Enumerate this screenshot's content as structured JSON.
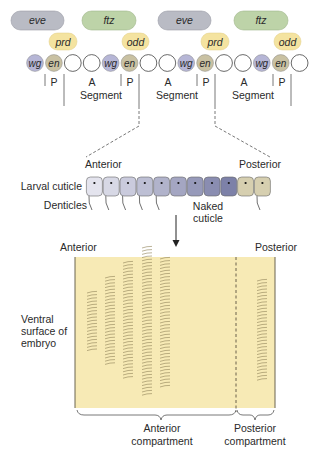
{
  "gene_pills": {
    "row1": [
      {
        "label": "eve",
        "kind": "eve"
      },
      {
        "label": "ftz",
        "kind": "ftz"
      },
      {
        "label": "eve",
        "kind": "eve"
      },
      {
        "label": "ftz",
        "kind": "ftz"
      }
    ],
    "row2": [
      {
        "label": "prd",
        "kind": "pair"
      },
      {
        "label": "odd",
        "kind": "pair"
      },
      {
        "label": "prd",
        "kind": "pair"
      },
      {
        "label": "odd",
        "kind": "pair"
      }
    ]
  },
  "cells": [
    "wg",
    "en",
    "",
    "",
    "wg",
    "en",
    "",
    "",
    "wg",
    "en",
    "",
    "",
    "wg",
    "en",
    ""
  ],
  "segment_labels": {
    "p": "P",
    "a": "A",
    "segment": "Segment"
  },
  "cuticle": {
    "anterior": "Anterior",
    "posterior": "Posterior",
    "larval_cuticle": "Larval cuticle",
    "denticles": "Denticles",
    "naked_cuticle": [
      "Naked",
      "cuticle"
    ],
    "cell_count": 11,
    "posterior_cells": 2
  },
  "embryo": {
    "anterior": "Anterior",
    "posterior": "Posterior",
    "ventral_surface": [
      "Ventral",
      "surface of",
      "embryo"
    ],
    "anterior_compartment": [
      "Anterior",
      "compartment"
    ],
    "posterior_compartment": [
      "Posterior",
      "compartment"
    ],
    "denticle_columns": 6
  },
  "colors": {
    "eve": "#b9bbc4",
    "ftz": "#bdd3a8",
    "pair": "#f4e3a0",
    "wg": "#b6b6d6",
    "en": "#c9c1a2",
    "embryo_fill": "#f7eab5",
    "cuticle_anterior": "#e4e4ee",
    "cuticle_posterior_blue": "#7d81a8",
    "cuticle_tan": "#d6cfb0",
    "denticle_stroke": "#8f8258"
  }
}
